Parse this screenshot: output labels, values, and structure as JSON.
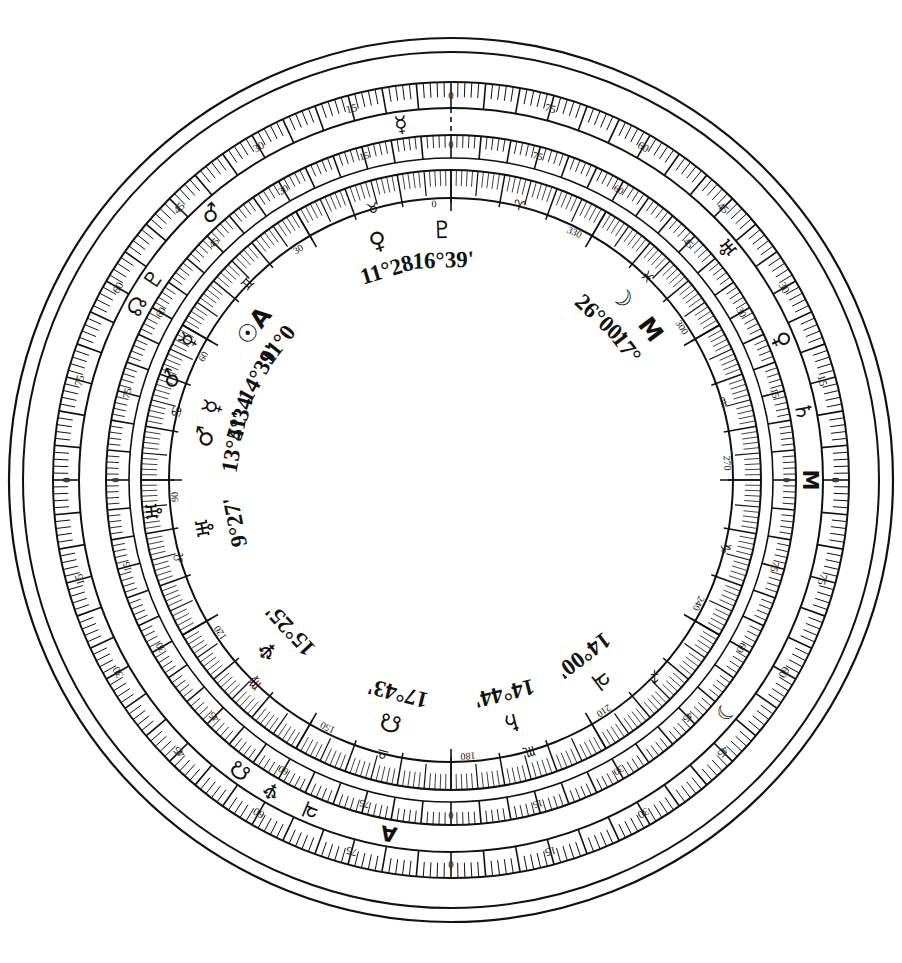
{
  "geometry": {
    "center_x": 451,
    "center_y": 480,
    "r_outer_rim": 442,
    "r_ring4_out": 398,
    "r_ring4_in": 372,
    "r_ring3_out": 345,
    "r_ring3_in": 322,
    "r_ring2_out": 310,
    "r_ring2_in": 285,
    "r_inner_disc": 282
  },
  "colors": {
    "ink": "#111111",
    "background": "#ffffff"
  },
  "rings": {
    "outer_scale": {
      "name": "outer-90-degree-scale",
      "span_degrees": 90,
      "repeats": 4,
      "major_labels": [
        "0",
        "5",
        "10",
        "15",
        "20",
        "25",
        "30",
        "35",
        "40",
        "45",
        "50",
        "55",
        "60",
        "65",
        "70",
        "75",
        "80",
        "85"
      ]
    },
    "middle_scale": {
      "name": "middle-90-degree-scale",
      "span_degrees": 90,
      "repeats": 4,
      "major_labels": [
        "0",
        "5",
        "10",
        "15",
        "20",
        "25",
        "30",
        "35",
        "40",
        "45",
        "50",
        "55",
        "60",
        "65",
        "70",
        "75",
        "80",
        "85"
      ]
    },
    "inner_scale": {
      "name": "inner-360-degree-zodiac-scale",
      "span_degrees": 360,
      "major_labels": [
        "0",
        "30",
        "60",
        "90",
        "120",
        "150",
        "180",
        "210",
        "240",
        "270",
        "300",
        "330"
      ],
      "zodiac_symbols": [
        "♈",
        "♉",
        "♊",
        "♋",
        "♌",
        "♍",
        "♎",
        "♏",
        "♐",
        "♑",
        "♒",
        "♓"
      ],
      "zodiac_names": [
        "Aries",
        "Taurus",
        "Gemini",
        "Cancer",
        "Leo",
        "Virgo",
        "Libra",
        "Scorpio",
        "Sagittarius",
        "Capricorn",
        "Aquarius",
        "Pisces"
      ]
    }
  },
  "ring_markers": [
    {
      "name": "marker-uranus-outer",
      "symbol": "⛢",
      "glyph": "♅",
      "ring": "outer",
      "angle_deg": 310
    },
    {
      "name": "marker-venus-outer",
      "symbol": "♀",
      "glyph": "♀",
      "ring": "outer",
      "angle_deg": 293
    },
    {
      "name": "marker-saturn-outer",
      "symbol": "♄",
      "glyph": "♄",
      "ring": "outer",
      "angle_deg": 281
    },
    {
      "name": "marker-midheaven-outer",
      "symbol": "M",
      "glyph": "M",
      "ring": "outer",
      "angle_deg": 270
    },
    {
      "name": "marker-moon-outer",
      "symbol": "☽",
      "glyph": "☽",
      "ring": "outer",
      "angle_deg": 230
    },
    {
      "name": "marker-ascendant-outer",
      "symbol": "A",
      "glyph": "A",
      "ring": "outer",
      "angle_deg": 170
    },
    {
      "name": "marker-jupiter-outer",
      "symbol": "♃",
      "glyph": "♃",
      "ring": "outer",
      "angle_deg": 157
    },
    {
      "name": "marker-neptune-outer",
      "symbol": "♆",
      "glyph": "♆",
      "ring": "outer",
      "angle_deg": 150
    },
    {
      "name": "marker-node-outer",
      "symbol": "☊",
      "glyph": "☊",
      "ring": "outer",
      "angle_deg": 144
    },
    {
      "name": "marker-mercury-outer",
      "symbol": "☿",
      "glyph": "☿",
      "ring": "outer",
      "angle_deg": 8
    },
    {
      "name": "marker-mars-outer",
      "symbol": "♂",
      "glyph": "♂",
      "ring": "outer",
      "angle_deg": 42
    },
    {
      "name": "marker-pluto-outer",
      "symbol": "♇",
      "glyph": "♇",
      "ring": "outer",
      "angle_deg": 56
    },
    {
      "name": "marker-node2-outer",
      "symbol": "☊",
      "glyph": "☊",
      "ring": "outer",
      "angle_deg": 61
    },
    {
      "name": "marker-uranus-inner",
      "symbol": "♅",
      "glyph": "♅",
      "ring": "inner",
      "angle_deg": 96
    },
    {
      "name": "marker-mars-inner",
      "symbol": "♂",
      "glyph": "♂",
      "ring": "inner",
      "angle_deg": 70
    },
    {
      "name": "marker-mercury-inner",
      "symbol": "☿",
      "glyph": "☿",
      "ring": "inner",
      "angle_deg": 62
    }
  ],
  "planet_positions": [
    {
      "name": "position-neptune",
      "planet": "Neptune",
      "symbol": "♆",
      "degrees": "15",
      "minutes": "25",
      "text": "15°25'",
      "angle_deg": 133,
      "label_angle": -50
    },
    {
      "name": "position-node",
      "planet": "Node",
      "symbol": "☊",
      "degrees": "17",
      "minutes": "43",
      "text": "17°43'",
      "angle_deg": 166,
      "label_angle": -18
    },
    {
      "name": "position-saturn",
      "planet": "Saturn",
      "symbol": "♄",
      "degrees": "14",
      "minutes": "44",
      "text": "14°44'",
      "angle_deg": 194,
      "label_angle": 16
    },
    {
      "name": "position-jupiter",
      "planet": "Jupiter",
      "symbol": "♃",
      "degrees": "14",
      "minutes": "00",
      "text": "14°00'",
      "angle_deg": 217,
      "label_angle": 40
    },
    {
      "name": "position-uranus",
      "planet": "Uranus",
      "symbol": "♅",
      "degrees": "9",
      "minutes": "27",
      "text": "9°27'",
      "angle_deg": 101,
      "label_angle": -82
    },
    {
      "name": "position-mars",
      "planet": "Mars",
      "symbol": "♂",
      "degrees": "13",
      "minutes": "41",
      "text": "13°41'",
      "angle_deg": 80,
      "label_angle": -70
    },
    {
      "name": "position-mercury",
      "planet": "Mercury",
      "symbol": "☿",
      "degrees": "5",
      "minutes": "34",
      "text": "5°34'",
      "angle_deg": 73,
      "label_angle": -63
    },
    {
      "name": "position-unknown",
      "planet": "Point",
      "symbol": "",
      "degrees": "14",
      "minutes": "39",
      "text": "14°39'",
      "angle_deg": 61,
      "label_angle": -52
    },
    {
      "name": "position-sun-ascendant",
      "planet": "Sun / Ascendant",
      "symbol": "☉A",
      "degrees": "11",
      "minutes": "0",
      "text": "11°0",
      "angle_deg": 52,
      "label_angle": -44
    },
    {
      "name": "position-venus",
      "planet": "Venus",
      "symbol": "♀",
      "degrees": "11",
      "minutes": "28",
      "text": "11°28",
      "angle_deg": 17,
      "label_angle": -8
    },
    {
      "name": "position-pluto",
      "planet": "Pluto",
      "symbol": "♇",
      "degrees": "16",
      "minutes": "39",
      "text": "16°39'",
      "angle_deg": 2,
      "label_angle": 6
    },
    {
      "name": "position-moon",
      "planet": "Moon",
      "symbol": "☽",
      "degrees": "26",
      "minutes": "00",
      "text": "26°00'",
      "angle_deg": 317,
      "label_angle": 58
    },
    {
      "name": "position-midheaven",
      "planet": "Midheaven",
      "symbol": "M",
      "degrees": "17",
      "minutes": "0",
      "text": "17°",
      "angle_deg": 307,
      "label_angle": 66
    }
  ],
  "scale_numbers_outer": [
    "0",
    "5",
    "10",
    "15",
    "20",
    "25",
    "30",
    "35",
    "40",
    "45",
    "50",
    "55",
    "60",
    "65",
    "70",
    "75",
    "80",
    "85"
  ],
  "scale_numbers_360": [
    "0",
    "30",
    "60",
    "90",
    "120",
    "150",
    "180",
    "210",
    "240",
    "270",
    "300",
    "330"
  ],
  "notes": {
    "zero_marker": "dashed radial line at top (0 degrees)",
    "style": "monochrome printed line-art dial"
  }
}
